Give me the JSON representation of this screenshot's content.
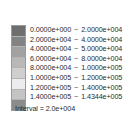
{
  "chart_data": {
    "type": "colorbar-legend",
    "title": "",
    "xlabel": "",
    "ylabel": "",
    "orientation": "vertical",
    "grid": false,
    "legend_position": "standalone",
    "separator": "~",
    "interval_label": "Interval = 2.0e+004",
    "interval_value": 20000,
    "vmin": 0,
    "vmax": 143440,
    "band_count": 8,
    "categories": [
      "0.0000e+000 ~ 2.0000e+004",
      "2.0000e+004 ~ 4.0000e+004",
      "4.0000e+004 ~ 5.0000e+004",
      "6.0000e+004 ~ 8.0000e+004",
      "8.0000e+004 ~ 1.0000e+005",
      "1.0000e+005 ~ 1.2000e+005",
      "1.2000e+005 ~ 1.4000e+005",
      "1.4000e+005 ~ 1.4344e+005"
    ],
    "bands": [
      {
        "lo": "0.0000e+000",
        "hi": "2.0000e+004",
        "lo_value": 0,
        "hi_value": 20000,
        "color": "#6e6e6e"
      },
      {
        "lo": "2.0000e+004",
        "hi": "4.0000e+004",
        "lo_value": 20000,
        "hi_value": 40000,
        "color": "#838383"
      },
      {
        "lo": "4.0000e+004",
        "hi": "5.0000e+004",
        "lo_value": 40000,
        "hi_value": 50000,
        "color": "#a2a2a2"
      },
      {
        "lo": "6.0000e+004",
        "hi": "8.0000e+004",
        "lo_value": 60000,
        "hi_value": 80000,
        "color": "#b8b8b8"
      },
      {
        "lo": "8.0000e+004",
        "hi": "1.0000e+005",
        "lo_value": 80000,
        "hi_value": 100000,
        "color": "#cfcfcf"
      },
      {
        "lo": "1.0000e+005",
        "hi": "1.2000e+005",
        "lo_value": 100000,
        "hi_value": 120000,
        "color": "#ececec"
      },
      {
        "lo": "1.2000e+005",
        "hi": "1.4000e+005",
        "lo_value": 120000,
        "hi_value": 140000,
        "color": "#c4c4c4"
      },
      {
        "lo": "1.4000e+005",
        "hi": "1.4344e+005",
        "lo_value": 140000,
        "hi_value": 143440,
        "color": "#8b8b8b"
      }
    ],
    "values": [
      20000,
      40000,
      50000,
      80000,
      100000,
      120000,
      140000,
      143440
    ],
    "colors": [
      "#6e6e6e",
      "#838383",
      "#a2a2a2",
      "#b8b8b8",
      "#cfcfcf",
      "#ececec",
      "#c4c4c4",
      "#8b8b8b"
    ],
    "background_color": "#ffffff",
    "text_color": "#2b2b2b",
    "border_color": "#9a9a9a"
  }
}
